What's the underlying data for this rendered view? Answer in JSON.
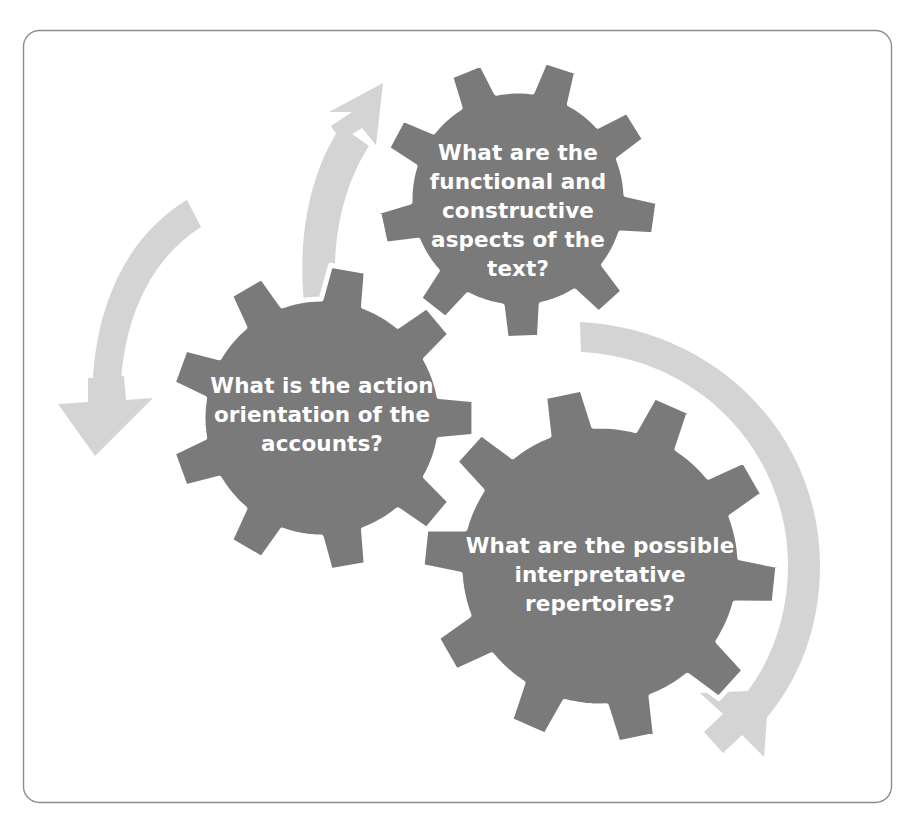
{
  "figure": {
    "background_color": "#ffffff",
    "frame": {
      "name": "rounded-border-frame",
      "stroke_color": "#8d8d8d",
      "fill_color": "#ffffff",
      "corner_radius": 16
    },
    "colors": {
      "gear_fill": "#7a7a7a",
      "gear_separator": "#ffffff",
      "arrow_fill": "#d4d4d4",
      "label_text": "#ffffff"
    }
  },
  "gears": [
    {
      "id": "gear-top",
      "name": "gear-functional-constructive",
      "lines": [
        "What are the",
        "functional and",
        "constructive",
        "aspects of the",
        "text?"
      ],
      "full_text": "What are the functional and constructive aspects of the text?",
      "cx": 518,
      "cy": 199,
      "radius": 108,
      "teeth": 9,
      "tooth_height": 32,
      "rotation": 8,
      "label_cx": 518,
      "label_start_y": 160,
      "line_height": 29
    },
    {
      "id": "gear-left",
      "name": "gear-action-orientation",
      "lines": [
        "What is the action",
        "orientation of the",
        "accounts?"
      ],
      "full_text": "What is the action orientation of the accounts?",
      "cx": 322,
      "cy": 418,
      "radius": 119,
      "teeth": 9,
      "tooth_height": 34,
      "rotation": 0,
      "label_cx": 322,
      "label_start_y": 393,
      "line_height": 29
    },
    {
      "id": "gear-bottom-right",
      "name": "gear-interpretative-repertoires",
      "lines": [
        "What are the possible",
        "interpretative",
        "repertoires?"
      ],
      "full_text": "What are the possible interpretative repertoires?",
      "cx": 600,
      "cy": 566,
      "radius": 140,
      "teeth": 10,
      "tooth_height": 38,
      "rotation": 6,
      "label_cx": 600,
      "label_start_y": 553,
      "line_height": 29
    }
  ],
  "arrows": [
    {
      "id": "arrow-up-right",
      "name": "arrow-rotation-top-left",
      "direction": "up-right",
      "description": "curved arrow sweeping up and to the right above the left gear"
    },
    {
      "id": "arrow-down-left",
      "name": "arrow-rotation-left-side",
      "direction": "down",
      "description": "curved arrow sweeping down along the left side"
    },
    {
      "id": "arrow-clockwise-right",
      "name": "arrow-rotation-right-side",
      "direction": "down-right",
      "description": "large curved arrow sweeping clockwise around the right gear"
    }
  ]
}
